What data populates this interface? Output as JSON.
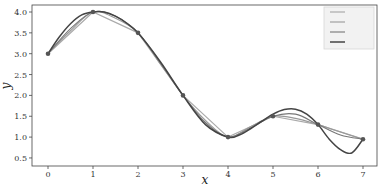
{
  "chart_data": {
    "type": "line",
    "title": "",
    "xlabel": "x",
    "ylabel": "y",
    "xlim": [
      -0.35,
      7.3
    ],
    "ylim": [
      0.4,
      4.2
    ],
    "x_ticks": [
      0,
      1,
      2,
      3,
      4,
      5,
      6,
      7
    ],
    "y_ticks": [
      0.5,
      1.0,
      1.5,
      2.0,
      2.5,
      3.0,
      3.5,
      4.0
    ],
    "y_tick_labels": [
      "0.5",
      "1.0",
      "1.5",
      "2.0",
      "2.5",
      "3.0",
      "3.5",
      "4.0"
    ],
    "grid": false,
    "legend_position": "upper right",
    "points": {
      "x": [
        0,
        1,
        2,
        3,
        4,
        5,
        6,
        7
      ],
      "y": [
        3.0,
        4.0,
        3.5,
        2.0,
        1.0,
        1.5,
        1.3,
        0.95
      ]
    },
    "series": [
      {
        "name": "linear",
        "color": "#aaaaaa",
        "x": [
          0,
          1,
          2,
          3,
          4,
          5,
          6,
          7
        ],
        "y": [
          3.0,
          4.0,
          3.5,
          2.0,
          1.0,
          1.5,
          1.3,
          0.95
        ]
      },
      {
        "name": "smooth-1",
        "color": "#999999",
        "x": [
          0,
          0.5,
          1,
          1.5,
          2,
          2.5,
          3,
          3.5,
          4,
          4.5,
          5,
          5.5,
          6,
          6.5,
          7
        ],
        "y": [
          3.0,
          3.55,
          4.0,
          3.85,
          3.5,
          2.75,
          2.0,
          1.4,
          1.0,
          1.25,
          1.5,
          1.45,
          1.3,
          1.12,
          0.95
        ]
      },
      {
        "name": "smooth-2",
        "color": "#777777",
        "x": [
          0,
          0.5,
          1,
          1.5,
          2,
          2.5,
          3,
          3.5,
          4,
          4.5,
          5,
          5.5,
          6,
          6.5,
          7
        ],
        "y": [
          3.0,
          3.6,
          4.0,
          3.9,
          3.5,
          2.78,
          2.0,
          1.35,
          1.0,
          1.22,
          1.5,
          1.55,
          1.3,
          1.05,
          0.95
        ]
      },
      {
        "name": "cubic-spline",
        "color": "#444444",
        "x": [
          0,
          0.25,
          0.5,
          0.75,
          1,
          1.25,
          1.5,
          1.75,
          2,
          2.5,
          3,
          3.5,
          4,
          4.25,
          4.5,
          4.75,
          5,
          5.25,
          5.5,
          5.75,
          6,
          6.25,
          6.5,
          6.75,
          7
        ],
        "y": [
          3.0,
          3.4,
          3.72,
          3.93,
          4.0,
          4.0,
          3.9,
          3.73,
          3.5,
          2.8,
          2.0,
          1.3,
          1.0,
          1.05,
          1.2,
          1.38,
          1.55,
          1.66,
          1.67,
          1.55,
          1.3,
          0.95,
          0.7,
          0.62,
          0.95
        ]
      }
    ],
    "legend_entries": [
      "",
      "",
      "",
      ""
    ]
  },
  "caption": ""
}
